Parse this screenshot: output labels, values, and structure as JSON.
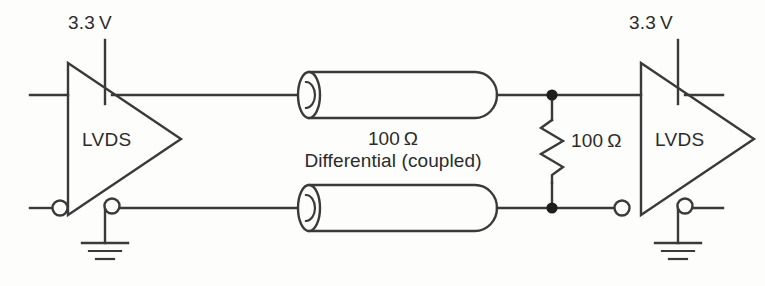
{
  "diagram": {
    "colors": {
      "background": "#fdfdfc",
      "ink": "#2b2b2b",
      "line": "#3a3a3a"
    }
  },
  "supplies": {
    "left": {
      "label": "3.3 V"
    },
    "right": {
      "label": "3.3 V"
    }
  },
  "drivers": {
    "left": {
      "label": "LVDS"
    },
    "right": {
      "label": "LVDS"
    }
  },
  "interconnect": {
    "impedance_label": "100 Ω",
    "type_label": "Differential (coupled)"
  },
  "termination": {
    "value_label": "100 Ω"
  },
  "icons": {
    "ground_left": "ground-icon",
    "ground_right": "ground-icon",
    "resistor": "resistor-icon",
    "cable_top": "coax-cable-icon",
    "cable_bottom": "coax-cable-icon",
    "buffer_left": "buffer-triangle-icon",
    "buffer_right": "buffer-triangle-icon",
    "bubble": "inversion-bubble-icon",
    "junction": "junction-dot-icon"
  }
}
